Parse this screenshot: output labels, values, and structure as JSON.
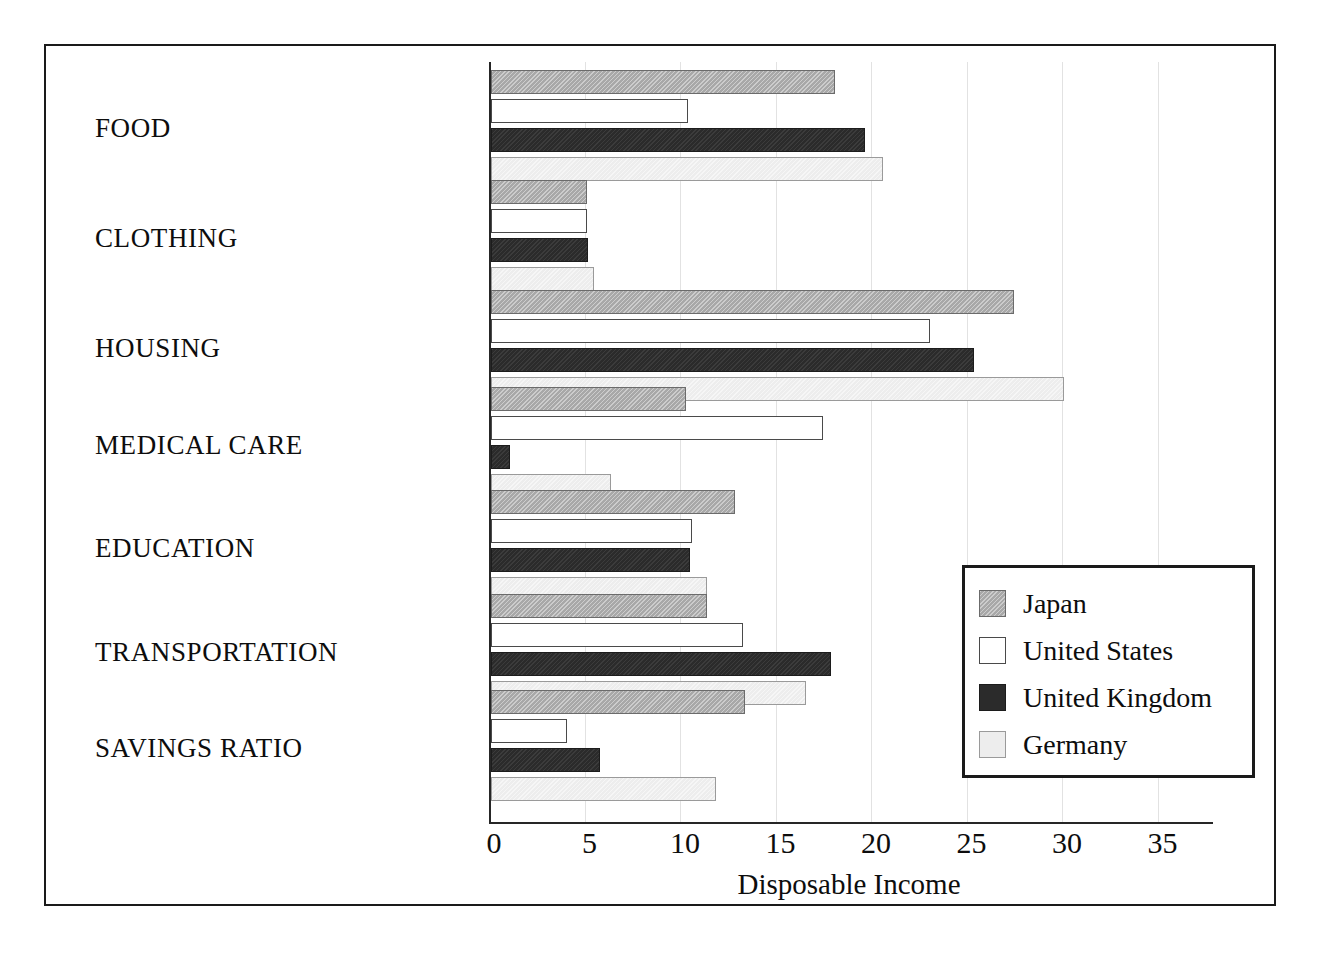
{
  "chart_data": {
    "type": "bar",
    "orientation": "horizontal",
    "title": "",
    "xlabel": "Disposable Income",
    "ylabel": "",
    "xlim": [
      0,
      37
    ],
    "xticks": [
      0,
      5,
      10,
      15,
      20,
      25,
      30,
      35
    ],
    "xtick_labels": [
      "0",
      "5",
      "10",
      "15",
      "20",
      "25",
      "30",
      "35"
    ],
    "grid": true,
    "grid_axis": "x",
    "legend_position": "lower right",
    "categories": [
      "FOOD",
      "CLOTHING",
      "HOUSING",
      "MEDICAL CARE",
      "EDUCATION",
      "TRANSPORTATION",
      "SAVINGS RATIO"
    ],
    "series": [
      {
        "name": "Japan",
        "color": "#a8a8a8",
        "values": [
          18.0,
          5.0,
          27.4,
          10.2,
          12.8,
          11.3,
          13.3
        ]
      },
      {
        "name": "United States",
        "color": "#ffffff",
        "values": [
          10.3,
          5.0,
          23.0,
          17.4,
          10.5,
          13.2,
          4.0
        ]
      },
      {
        "name": "United Kingdom",
        "color": "#2b2b2b",
        "values": [
          19.6,
          5.1,
          25.3,
          1.0,
          10.4,
          17.8,
          5.7
        ]
      },
      {
        "name": "Germany",
        "color": "#ededed",
        "values": [
          20.5,
          5.4,
          30.0,
          6.3,
          11.3,
          16.5,
          11.8
        ]
      }
    ]
  },
  "legend": {
    "items": [
      {
        "label": "Japan",
        "swatch": "japan"
      },
      {
        "label": "United States",
        "swatch": "us"
      },
      {
        "label": "United Kingdom",
        "swatch": "uk"
      },
      {
        "label": "Germany",
        "swatch": "germany"
      }
    ]
  }
}
